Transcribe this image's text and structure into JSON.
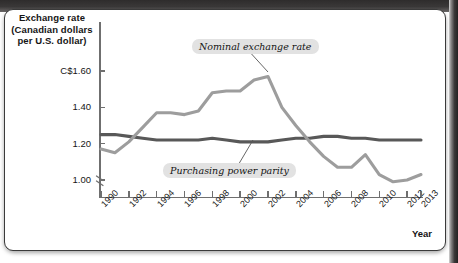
{
  "figure": {
    "y_axis_title": [
      "Exchange rate",
      "(Canadian dollars",
      "per U.S. dollar)"
    ],
    "x_axis_title": "Year",
    "callout_nominal": "Nominal exchange rate",
    "callout_ppp": "Purchasing power parity"
  },
  "colors": {
    "nominal_line": "#9d9d9d",
    "ppp_line": "#585858",
    "axis": "#6f6f6f",
    "callout_bg": "#e2e2e2",
    "text": "#141414",
    "frame": "#3a3a3a"
  },
  "chart_data": {
    "type": "line",
    "title": "",
    "xlabel": "Year",
    "ylabel": "Exchange rate (Canadian dollars per U.S. dollar)",
    "ylim": [
      0.94,
      1.7
    ],
    "xlim": [
      1990,
      2013
    ],
    "grid": false,
    "axis_break": true,
    "legend": "inline-callouts",
    "ytick_labels": [
      "C$1.60",
      "1.40",
      "1.20",
      "1.00"
    ],
    "ytick_values": [
      1.6,
      1.4,
      1.2,
      1.0
    ],
    "xtick_labels": [
      "1990",
      "1992",
      "1994",
      "1996",
      "1998",
      "2000",
      "2002",
      "2004",
      "2006",
      "2008",
      "2010",
      "2012",
      "2013"
    ],
    "xtick_values": [
      1990,
      1992,
      1994,
      1996,
      1998,
      2000,
      2002,
      2004,
      2006,
      2008,
      2010,
      2012,
      2013
    ],
    "x": [
      1990,
      1991,
      1992,
      1993,
      1994,
      1995,
      1996,
      1997,
      1998,
      1999,
      2000,
      2001,
      2002,
      2003,
      2004,
      2005,
      2006,
      2007,
      2008,
      2009,
      2010,
      2011,
      2012,
      2013
    ],
    "series": [
      {
        "name": "Nominal exchange rate",
        "color": "#9d9d9d",
        "values": [
          1.17,
          1.15,
          1.21,
          1.29,
          1.37,
          1.37,
          1.36,
          1.38,
          1.48,
          1.49,
          1.49,
          1.55,
          1.57,
          1.4,
          1.3,
          1.21,
          1.13,
          1.07,
          1.07,
          1.14,
          1.03,
          0.99,
          1.0,
          1.03
        ]
      },
      {
        "name": "Purchasing power parity",
        "color": "#585858",
        "values": [
          1.25,
          1.25,
          1.24,
          1.23,
          1.22,
          1.22,
          1.22,
          1.22,
          1.23,
          1.22,
          1.21,
          1.21,
          1.21,
          1.22,
          1.23,
          1.23,
          1.24,
          1.24,
          1.23,
          1.23,
          1.22,
          1.22,
          1.22,
          1.22
        ]
      }
    ]
  }
}
